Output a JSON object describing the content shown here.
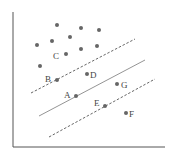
{
  "diagram": {
    "type": "svm-margin-illustration",
    "axes": {
      "y_axis": {
        "x": 13,
        "y1": 12,
        "y2": 147
      },
      "x_axis": {
        "y": 147,
        "x1": 13,
        "x2": 165
      }
    },
    "lines": [
      {
        "name": "upper-margin",
        "style": "dashed",
        "x1": 31,
        "y1": 93,
        "x2": 135,
        "y2": 39
      },
      {
        "name": "decision-boundary",
        "style": "solid",
        "x1": 39,
        "y1": 116,
        "x2": 145,
        "y2": 60
      },
      {
        "name": "lower-margin",
        "style": "dashed",
        "x1": 49,
        "y1": 137,
        "x2": 155,
        "y2": 79
      }
    ],
    "unlabeled_points": [
      {
        "x": 57,
        "y": 25
      },
      {
        "x": 81,
        "y": 28
      },
      {
        "x": 99,
        "y": 30
      },
      {
        "x": 37,
        "y": 45
      },
      {
        "x": 52,
        "y": 41
      },
      {
        "x": 70,
        "y": 37
      },
      {
        "x": 81,
        "y": 49
      },
      {
        "x": 97,
        "y": 46
      },
      {
        "x": 40,
        "y": 66
      }
    ],
    "labeled_points": [
      {
        "label": "A",
        "x": 76,
        "y": 96,
        "lx": 64,
        "ly": 98
      },
      {
        "label": "B",
        "x": 57,
        "y": 80,
        "lx": 45,
        "ly": 82
      },
      {
        "label": "C",
        "x": 66,
        "y": 54,
        "lx": 53,
        "ly": 59
      },
      {
        "label": "D",
        "x": 87,
        "y": 74,
        "lx": 90,
        "ly": 78
      },
      {
        "label": "E",
        "x": 105,
        "y": 106,
        "lx": 94,
        "ly": 106
      },
      {
        "label": "F",
        "x": 126,
        "y": 113,
        "lx": 129,
        "ly": 117
      },
      {
        "label": "G",
        "x": 117,
        "y": 84,
        "lx": 121,
        "ly": 88
      }
    ],
    "colors": {
      "axis": "#555555",
      "line": "#888888",
      "dashed": "#555555",
      "point": "#666666"
    }
  }
}
